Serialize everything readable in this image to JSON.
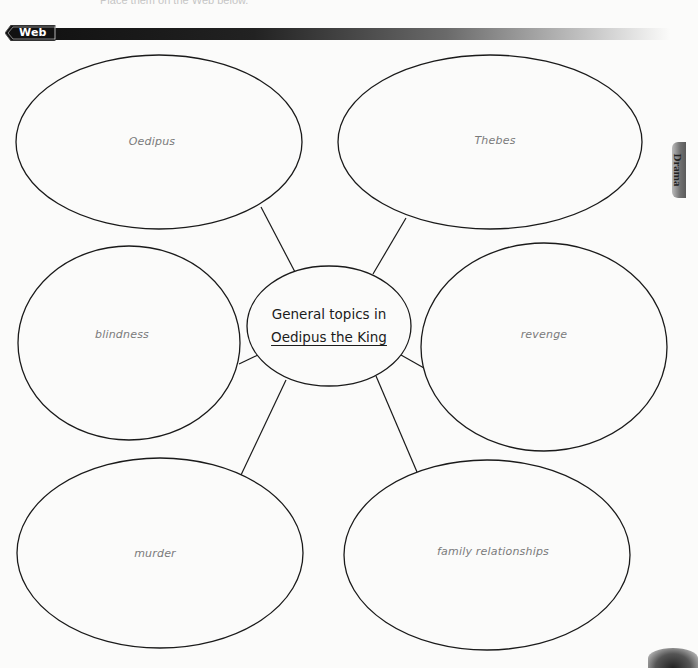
{
  "page": {
    "top_text": "Place them on the Web below.",
    "section_tab": {
      "label": "Web",
      "icon": "arrow-tab-icon"
    },
    "side_tab": {
      "label": "Drama"
    }
  },
  "diagram": {
    "type": "web",
    "center": {
      "line1": "General topics in",
      "line2": "Oedipus the King",
      "cx": 329,
      "cy": 326,
      "rx": 82,
      "ry": 60
    },
    "nodes": [
      {
        "id": "oedipus",
        "label": "Oedipus",
        "cx": 159,
        "cy": 142,
        "rx": 143,
        "ry": 87,
        "lx": 152,
        "ly": 141
      },
      {
        "id": "thebes",
        "label": "Thebes",
        "cx": 490,
        "cy": 142,
        "rx": 152,
        "ry": 87,
        "lx": 495,
        "ly": 140
      },
      {
        "id": "blindness",
        "label": "blindness",
        "cx": 129,
        "cy": 343,
        "rx": 111,
        "ry": 97,
        "lx": 122,
        "ly": 334
      },
      {
        "id": "revenge",
        "label": "revenge",
        "cx": 544,
        "cy": 347,
        "rx": 123,
        "ry": 104,
        "lx": 544,
        "ly": 334
      },
      {
        "id": "murder",
        "label": "murder",
        "cx": 160,
        "cy": 553,
        "rx": 143,
        "ry": 95,
        "lx": 155,
        "ly": 553
      },
      {
        "id": "family-relationships",
        "label": "family relationships",
        "cx": 487,
        "cy": 555,
        "rx": 143,
        "ry": 95,
        "lx": 493,
        "ly": 551
      }
    ],
    "connectors": [
      {
        "from": "oedipus",
        "x1": 261,
        "y1": 207,
        "x2": 295,
        "y2": 272
      },
      {
        "from": "thebes",
        "x1": 406,
        "y1": 218,
        "x2": 373,
        "y2": 274
      },
      {
        "from": "blindness",
        "x1": 239,
        "y1": 364,
        "x2": 258,
        "y2": 355
      },
      {
        "from": "revenge",
        "x1": 401,
        "y1": 355,
        "x2": 424,
        "y2": 368
      },
      {
        "from": "murder",
        "x1": 241,
        "y1": 475,
        "x2": 286,
        "y2": 380
      },
      {
        "from": "family-relationships",
        "x1": 417,
        "y1": 472,
        "x2": 376,
        "y2": 376
      }
    ],
    "colors": {
      "stroke": "#1a1a1a",
      "node_text": "#7a7a7a",
      "center_text": "#1c1c1c"
    }
  }
}
